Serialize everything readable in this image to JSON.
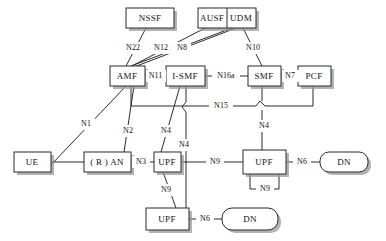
{
  "diagram": {
    "type": "network-architecture",
    "nodes": [
      {
        "id": "nssf",
        "label": "NSSF",
        "shape": "rect",
        "x": 126,
        "y": 8,
        "w": 48,
        "h": 20
      },
      {
        "id": "ausf",
        "label": "AUSF",
        "shape": "rect",
        "x": 198,
        "y": 8,
        "w": 29,
        "h": 20
      },
      {
        "id": "udm",
        "label": "UDM",
        "shape": "rect",
        "x": 227,
        "y": 8,
        "w": 29,
        "h": 20
      },
      {
        "id": "amf",
        "label": "AMF",
        "shape": "rect",
        "x": 110,
        "y": 66,
        "w": 35,
        "h": 20
      },
      {
        "id": "ismf",
        "label": "I-SMF",
        "shape": "rect",
        "x": 166,
        "y": 66,
        "w": 39,
        "h": 20
      },
      {
        "id": "smf",
        "label": "SMF",
        "shape": "rect",
        "x": 248,
        "y": 66,
        "w": 33,
        "h": 20
      },
      {
        "id": "pcf",
        "label": "PCF",
        "shape": "rect",
        "x": 298,
        "y": 66,
        "w": 33,
        "h": 20
      },
      {
        "id": "ue",
        "label": "UE",
        "shape": "rect",
        "x": 14,
        "y": 152,
        "w": 37,
        "h": 20
      },
      {
        "id": "ran",
        "label": "( R ) AN",
        "shape": "rect",
        "x": 84,
        "y": 152,
        "w": 47,
        "h": 20
      },
      {
        "id": "upf1",
        "label": "UPF",
        "shape": "rect",
        "x": 154,
        "y": 152,
        "w": 27,
        "h": 20
      },
      {
        "id": "upf2",
        "label": "UPF",
        "shape": "rect",
        "x": 243,
        "y": 150,
        "w": 43,
        "h": 24
      },
      {
        "id": "upf3",
        "label": "UPF",
        "shape": "rect",
        "x": 146,
        "y": 208,
        "w": 43,
        "h": 22
      },
      {
        "id": "dn1",
        "label": "DN",
        "shape": "round",
        "x": 320,
        "y": 152,
        "w": 48,
        "h": 20
      },
      {
        "id": "dn2",
        "label": "DN",
        "shape": "round",
        "x": 222,
        "y": 208,
        "w": 56,
        "h": 22
      }
    ],
    "link_labels": [
      {
        "id": "n22",
        "text": "N22",
        "x": 133,
        "y": 48
      },
      {
        "id": "n12",
        "text": "N12",
        "x": 161,
        "y": 48
      },
      {
        "id": "n8",
        "text": "N8",
        "x": 182,
        "y": 48
      },
      {
        "id": "n10",
        "text": "N10",
        "x": 253,
        "y": 48
      },
      {
        "id": "n11",
        "text": "N11",
        "x": 155,
        "y": 76
      },
      {
        "id": "n16a",
        "text": "N16a",
        "x": 226,
        "y": 76
      },
      {
        "id": "n7",
        "text": "N7",
        "x": 290,
        "y": 76
      },
      {
        "id": "n15",
        "text": "N15",
        "x": 221,
        "y": 106
      },
      {
        "id": "n1",
        "text": "N1",
        "x": 86,
        "y": 124
      },
      {
        "id": "n2",
        "text": "N2",
        "x": 128,
        "y": 131
      },
      {
        "id": "n4a",
        "text": "N4",
        "x": 166,
        "y": 131
      },
      {
        "id": "n4b",
        "text": "N4",
        "x": 184,
        "y": 145
      },
      {
        "id": "n4c",
        "text": "N4",
        "x": 264,
        "y": 126
      },
      {
        "id": "n3",
        "text": "N3",
        "x": 141,
        "y": 162
      },
      {
        "id": "n9a",
        "text": "N9",
        "x": 215,
        "y": 162
      },
      {
        "id": "n6a",
        "text": "N6",
        "x": 302,
        "y": 162
      },
      {
        "id": "n9b",
        "text": "N9",
        "x": 166,
        "y": 190
      },
      {
        "id": "n9c",
        "text": "N9",
        "x": 265,
        "y": 189
      },
      {
        "id": "n6b",
        "text": "N6",
        "x": 205,
        "y": 219
      }
    ],
    "interfaces": [
      "N1",
      "N2",
      "N3",
      "N4",
      "N6",
      "N7",
      "N8",
      "N9",
      "N10",
      "N11",
      "N12",
      "N15",
      "N16a",
      "N22"
    ],
    "colors": {
      "stroke": "#2b2b2b",
      "box_fill": "#ffffff",
      "shadow": "#9a9a9a",
      "background": "#ffffff",
      "text": "#111111"
    }
  }
}
